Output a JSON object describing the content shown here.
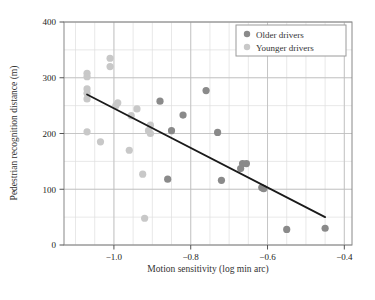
{
  "chart_data": {
    "type": "scatter",
    "title": "",
    "xlabel": "Motion sensitivity (log min arc)",
    "ylabel": "Pedestrian recognition distance (m)",
    "xlim": [
      -1.13,
      -0.38
    ],
    "ylim": [
      0,
      400
    ],
    "xticks": [
      -1.0,
      -0.8,
      -0.6,
      -0.4
    ],
    "xticklabels": [
      "−1.0",
      "−0.8",
      "−0.6",
      "−0.4"
    ],
    "yticks": [
      0,
      100,
      200,
      300,
      400
    ],
    "yticklabels": [
      "0",
      "100",
      "200",
      "300",
      "400"
    ],
    "grid": true,
    "grid_minor_x_step": 0.05,
    "grid_minor_y_step": 50,
    "legend_position": "top-right",
    "series": [
      {
        "name": "Older drivers",
        "color": "#8a8a8a",
        "marker": "circle",
        "points": [
          [
            -0.88,
            258
          ],
          [
            -0.82,
            233
          ],
          [
            -0.85,
            205
          ],
          [
            -0.76,
            277
          ],
          [
            -0.73,
            202
          ],
          [
            -0.86,
            118
          ],
          [
            -0.72,
            116
          ],
          [
            -0.665,
            146
          ],
          [
            -0.67,
            137
          ],
          [
            -0.655,
            146
          ],
          [
            -0.615,
            103
          ],
          [
            -0.61,
            101
          ],
          [
            -0.55,
            28
          ],
          [
            -0.45,
            30
          ]
        ]
      },
      {
        "name": "Younger drivers",
        "color": "#c8c8c8",
        "marker": "circle",
        "points": [
          [
            -1.07,
            308
          ],
          [
            -1.07,
            302
          ],
          [
            -1.07,
            280
          ],
          [
            -1.07,
            272
          ],
          [
            -1.07,
            262
          ],
          [
            -1.07,
            203
          ],
          [
            -1.01,
            335
          ],
          [
            -1.01,
            320
          ],
          [
            -1.035,
            185
          ],
          [
            -0.99,
            255
          ],
          [
            -0.995,
            250
          ],
          [
            -0.96,
            170
          ],
          [
            -0.955,
            232
          ],
          [
            -0.94,
            244
          ],
          [
            -0.92,
            48
          ],
          [
            -0.925,
            127
          ],
          [
            -0.905,
            215
          ],
          [
            -0.91,
            205
          ],
          [
            -0.905,
            200
          ]
        ]
      }
    ],
    "trendline": {
      "name": "regression-line",
      "color": "#1a1a1a",
      "x_start": -1.07,
      "y_start": 270,
      "x_end": -0.45,
      "y_end": 50
    }
  },
  "legend": {
    "entries": [
      {
        "label": "Older drivers",
        "color": "#8a8a8a"
      },
      {
        "label": "Younger drivers",
        "color": "#c8c8c8"
      }
    ]
  }
}
